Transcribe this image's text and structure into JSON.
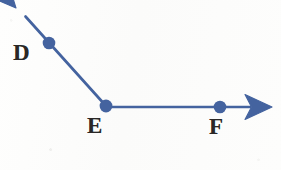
{
  "figure": {
    "background_color": "#fdfdfc",
    "stroke_color": "#44639f",
    "label_color": "#2a2826",
    "line_width": 2.6,
    "point_radius": 6.2
  },
  "points": [
    {
      "name": "D",
      "label": "D",
      "x": 49,
      "y": 43,
      "label_x": 13,
      "label_y": 41,
      "label_position": "left"
    },
    {
      "name": "E",
      "label": "E",
      "x": 106,
      "y": 106,
      "label_x": 87,
      "label_y": 114,
      "label_position": "below"
    },
    {
      "name": "F",
      "label": "F",
      "x": 220,
      "y": 107,
      "label_x": 209,
      "label_y": 115,
      "label_position": "below"
    }
  ],
  "rays": [
    {
      "name": "ray-ED",
      "from": "E",
      "through": "D",
      "start": {
        "x": 106,
        "y": 106
      },
      "end": {
        "x": 24,
        "y": 15
      },
      "arrow_tip": {
        "x": 16,
        "y": 8
      },
      "direction": "up-left"
    },
    {
      "name": "ray-EF",
      "from": "E",
      "through": "F",
      "start": {
        "x": 106,
        "y": 106
      },
      "end": {
        "x": 248,
        "y": 107
      },
      "arrow_tip": {
        "x": 272,
        "y": 107
      },
      "direction": "right"
    }
  ],
  "arrowheads": [
    {
      "name": "arrowhead-D",
      "tip_x": 16,
      "tip_y": 8,
      "angle_deg": 228,
      "length": 27,
      "half_width": 13
    },
    {
      "name": "arrowhead-F",
      "tip_x": 272,
      "tip_y": 107,
      "angle_deg": 0,
      "length": 27,
      "half_width": 13
    }
  ]
}
